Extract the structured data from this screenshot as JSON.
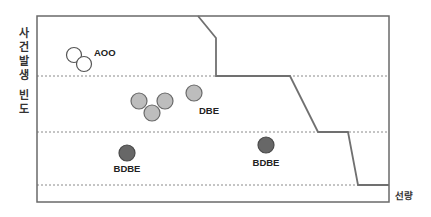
{
  "diagram": {
    "y_axis_label_line1": [
      "사",
      "건",
      "발",
      "생"
    ],
    "y_axis_label_line2": [
      "빈",
      "도"
    ],
    "x_axis_label": "선량",
    "frame": {
      "x0": 37,
      "y0": 16,
      "x1": 389,
      "y1": 202
    },
    "dashed_lines_y": [
      76,
      132,
      185
    ],
    "boundary_curve": [
      [
        198,
        16
      ],
      [
        216,
        38
      ],
      [
        216,
        76
      ],
      [
        290,
        76
      ],
      [
        318,
        132
      ],
      [
        348,
        132
      ],
      [
        358,
        185
      ],
      [
        389,
        185
      ]
    ],
    "colors": {
      "frame": "#6a6a6a",
      "curve": "#707070",
      "dashed": "#8a8a8a",
      "aoo_fill": "#ffffff",
      "aoo_stroke": "#555555",
      "dbe_fill": "#bdbdbd",
      "dbe_stroke": "#6a6a6a",
      "bdbe_fill": "#676767",
      "bdbe_stroke": "#4a4a4a",
      "text": "#222222"
    },
    "groups": [
      {
        "label": "AOO",
        "label_pos": [
          94,
          56
        ],
        "label_anchor": "start",
        "type": "open",
        "circles": [
          [
            74,
            55,
            7.5
          ],
          [
            84,
            64,
            7.5
          ]
        ]
      },
      {
        "label": "DBE",
        "label_pos": [
          209,
          114
        ],
        "label_anchor": "middle",
        "type": "light",
        "circles": [
          [
            139,
            101,
            8
          ],
          [
            165,
            101,
            8
          ],
          [
            152,
            113,
            8
          ],
          [
            194,
            93,
            8
          ]
        ]
      },
      {
        "label": "BDBE",
        "label_pos": [
          127,
          172
        ],
        "label_anchor": "middle",
        "type": "dark",
        "circles": [
          [
            127,
            153,
            8
          ]
        ]
      },
      {
        "label": "BDBE",
        "label_pos": [
          266,
          166
        ],
        "label_anchor": "middle",
        "type": "dark",
        "circles": [
          [
            266,
            145,
            8
          ]
        ]
      }
    ]
  }
}
